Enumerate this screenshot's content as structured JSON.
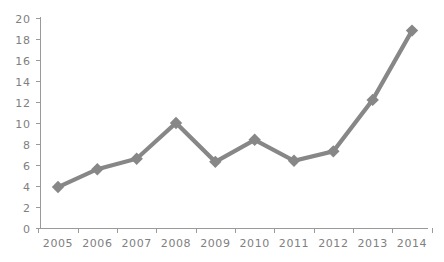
{
  "chart_data": {
    "type": "line",
    "title": "",
    "subtitle": "",
    "xlabel": "",
    "ylabel": "",
    "categories": [
      "2005",
      "2006",
      "2007",
      "2008",
      "2009",
      "2010",
      "2011",
      "2012",
      "2013",
      "2014"
    ],
    "values": [
      3.9,
      5.6,
      6.6,
      10.0,
      6.3,
      8.4,
      6.4,
      7.3,
      12.2,
      18.8
    ],
    "series": [
      {
        "name": "",
        "values": [
          3.9,
          5.6,
          6.6,
          10.0,
          6.3,
          8.4,
          6.4,
          7.3,
          12.2,
          18.8
        ]
      }
    ],
    "ylim": [
      0,
      20
    ],
    "y_ticks": [
      "0",
      "2",
      "4",
      "6",
      "8",
      "10",
      "12",
      "14",
      "16",
      "18",
      "20"
    ],
    "y_tick_values": [
      0,
      2,
      4,
      6,
      8,
      10,
      12,
      14,
      16,
      18,
      20
    ],
    "x_ticks": [
      "2005",
      "2006",
      "2007",
      "2008",
      "2009",
      "2010",
      "2011",
      "2012",
      "2013",
      "2014"
    ],
    "grid": false,
    "legend": false,
    "legend_position": "none",
    "marker": "diamond",
    "line_color": "#878787",
    "marker_color": "#878787",
    "axis_color": "#9a9a9a",
    "tick_label_color": "#808080",
    "background_color": "#ffffff",
    "annotations": []
  }
}
